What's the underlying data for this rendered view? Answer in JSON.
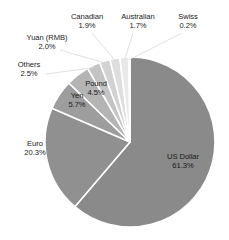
{
  "chart_data": {
    "type": "pie",
    "title": "",
    "subtitle": "",
    "xlabel": "",
    "ylabel": "",
    "legend_position": "none",
    "grid": false,
    "units": "percent",
    "start_angle_deg": 0,
    "direction": "clockwise",
    "categories": [
      "US Dollar",
      "Euro",
      "Yen",
      "Pound",
      "Others",
      "Yuan (RMB)",
      "Canadian",
      "Australian",
      "Swiss"
    ],
    "values": [
      61.3,
      20.3,
      5.7,
      4.5,
      2.5,
      2.0,
      1.9,
      1.7,
      0.2
    ],
    "slices": [
      {
        "name": "US Dollar",
        "value": 61.3,
        "value_label": "61.3%",
        "color": "#8a8a8a",
        "label_placement": "inside"
      },
      {
        "name": "Euro",
        "value": 20.3,
        "value_label": "20.3%",
        "color": "#909090",
        "label_placement": "inside"
      },
      {
        "name": "Yen",
        "value": 5.7,
        "value_label": "5.7%",
        "color": "#9d9d9d",
        "label_placement": "inside"
      },
      {
        "name": "Pound",
        "value": 4.5,
        "value_label": "4.5%",
        "color": "#b4b4b4",
        "label_placement": "inside"
      },
      {
        "name": "Others",
        "value": 2.5,
        "value_label": "2.5%",
        "color": "#c4c4c4",
        "label_placement": "outside"
      },
      {
        "name": "Yuan (RMB)",
        "value": 2.0,
        "value_label": "2.0%",
        "color": "#d2d2d2",
        "label_placement": "outside"
      },
      {
        "name": "Canadian",
        "value": 1.9,
        "value_label": "1.9%",
        "color": "#dedede",
        "label_placement": "outside"
      },
      {
        "name": "Australian",
        "value": 1.7,
        "value_label": "1.7%",
        "color": "#e9e9e9",
        "label_placement": "outside"
      },
      {
        "name": "Swiss",
        "value": 0.2,
        "value_label": "0.2%",
        "color": "#f2f2f2",
        "label_placement": "outside"
      }
    ]
  },
  "labels": {
    "usd": {
      "name": "US Dollar",
      "value": "61.3%"
    },
    "euro": {
      "name": "Euro",
      "value": "20.3%"
    },
    "yen": {
      "name": "Yen",
      "value": "5.7%"
    },
    "pound": {
      "name": "Pound",
      "value": "4.5%"
    },
    "others": {
      "name": "Others",
      "value": "2.5%"
    },
    "yuan": {
      "name": "Yuan (RMB)",
      "value": "2.0%"
    },
    "canadian": {
      "name": "Canadian",
      "value": "1.9%"
    },
    "australian": {
      "name": "Australian",
      "value": "1.7%"
    },
    "swiss": {
      "name": "Swiss",
      "value": "0.2%"
    }
  },
  "style": {
    "background": "#ffffff",
    "separator_color": "#ffffff",
    "text_color": "#1d1d1d"
  },
  "geometry": {
    "center_x": 130,
    "center_y": 142,
    "radius": 85
  }
}
